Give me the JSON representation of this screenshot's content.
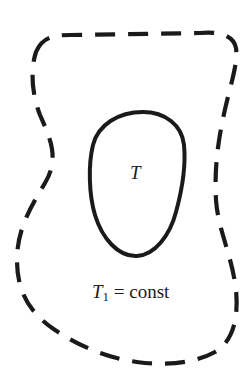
{
  "diagram": {
    "inner_region": {
      "label": "T",
      "stroke": "solid"
    },
    "outer_region": {
      "label_var": "T",
      "label_sub": "1",
      "label_rest": " = const",
      "stroke": "dashed"
    },
    "colors": {
      "stroke": "#1a1a1a",
      "background": "#ffffff"
    }
  }
}
